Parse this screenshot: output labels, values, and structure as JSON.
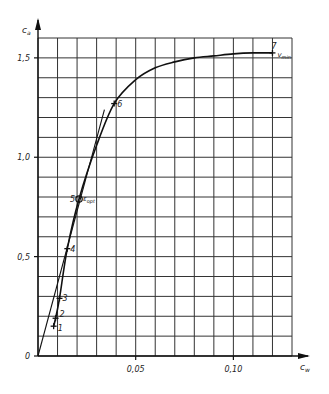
{
  "chart_data": {
    "type": "line",
    "title": "",
    "xlabel": "c_w",
    "ylabel": "c_a",
    "xlim": [
      0,
      0.13
    ],
    "ylim": [
      0,
      1.6
    ],
    "grid": true,
    "x_grid_step": 0.01,
    "y_grid_step": 0.1,
    "x_ticks": [
      {
        "value": 0.05,
        "label": "0,05"
      },
      {
        "value": 0.1,
        "label": "0,10"
      }
    ],
    "y_ticks": [
      {
        "value": 0,
        "label": "0"
      },
      {
        "value": 0.5,
        "label": "0,5"
      },
      {
        "value": 1.0,
        "label": "1,0"
      },
      {
        "value": 1.5,
        "label": "1,5"
      }
    ],
    "series": [
      {
        "name": "polar",
        "x": [
          0.008,
          0.009,
          0.011,
          0.015,
          0.021,
          0.03,
          0.039,
          0.05,
          0.06,
          0.07,
          0.08,
          0.09,
          0.1,
          0.11,
          0.12
        ],
        "y": [
          0.15,
          0.19,
          0.29,
          0.54,
          0.79,
          1.06,
          1.27,
          1.39,
          1.45,
          1.48,
          1.5,
          1.51,
          1.52,
          1.525,
          1.525
        ]
      },
      {
        "name": "tangent-from-origin",
        "x": [
          0.0,
          0.034
        ],
        "y": [
          0.0,
          1.24
        ]
      }
    ],
    "points": [
      {
        "id": "1",
        "x": 0.008,
        "y": 0.15
      },
      {
        "id": "2",
        "x": 0.009,
        "y": 0.19
      },
      {
        "id": "3",
        "x": 0.011,
        "y": 0.29
      },
      {
        "id": "4",
        "x": 0.015,
        "y": 0.54
      },
      {
        "id": "5",
        "x": 0.021,
        "y": 0.79,
        "annotation": "ε_opt"
      },
      {
        "id": "6",
        "x": 0.039,
        "y": 1.27
      },
      {
        "id": "7",
        "x": 0.12,
        "y": 1.525,
        "annotation": "v_min"
      }
    ]
  },
  "labels": {
    "x_axis": "c",
    "x_axis_sub": "w",
    "y_axis": "c",
    "y_axis_sub": "a",
    "eps_opt": "ε",
    "eps_opt_sub": "opt",
    "v_min": "v",
    "v_min_sub": "min"
  }
}
